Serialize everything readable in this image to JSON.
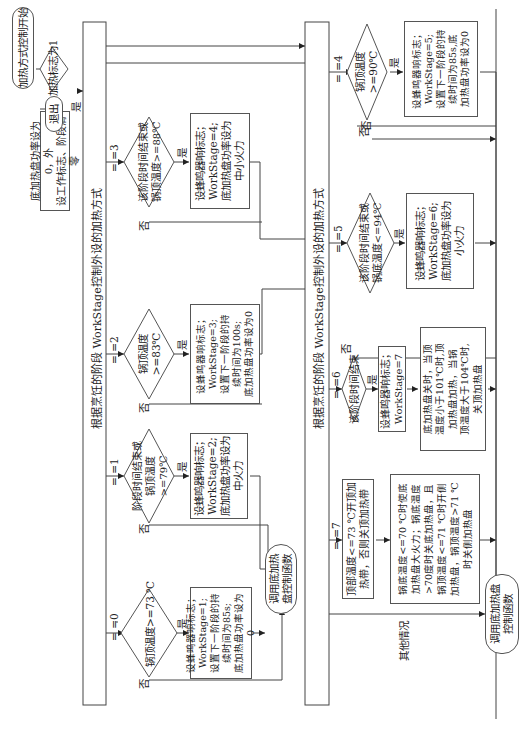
{
  "diagram": {
    "orientation": "rotated 90 degrees clockwise",
    "start": "加热方式控制开始",
    "flag_check": {
      "text": "加热标志为1",
      "yes": "是",
      "no": "否"
    },
    "reset_box": "底加热盘功率设为0，外\n设工作标志、阶段清零",
    "exit": "退出",
    "section_title_top": "根据烹饪的阶段 WorkStage控制外设的加热方式",
    "section_title_bottom": "根据烹饪的阶段 WorkStage控制外设的加热方式",
    "branches": [
      {
        "case": "= =0",
        "decision": "锅顶温度>=73 ℃",
        "yes": "是",
        "no": "否",
        "action": "设蜂鸣器响标志；\nWorkStage=1;\n设置下一阶段的持\n续时间为85s;\n底加热盘功率设为0"
      },
      {
        "case": "= =1",
        "decision": "阶段时间结束或\n锅顶温度>=79℃",
        "yes": "是",
        "no": "否",
        "action": "设蜂鸣器响标志；\nWorkStage=2;\n底加热盘功率设为\n中火力"
      },
      {
        "case": "= =2",
        "decision": "锅顶温度>=83℃",
        "yes": "是",
        "no": "否",
        "action": "设蜂鸣器响标志；\nWorkStage=3;\n设置下一阶段的持\n续时间为100s;\n底加热盘功率设为0"
      },
      {
        "case": "= =3",
        "decision": "该阶段时间结束或\n锅顶温度>=88℃",
        "yes": "是",
        "no": "否",
        "action": "设蜂鸣器响标志；\nWorkStage=4;\n底加热盘功率设为\n中小火力"
      },
      {
        "case": "= =4",
        "decision": "锅顶温度>=90℃",
        "yes": "是",
        "no": "否",
        "action": "设蜂鸣器响标志；\nWorkStage=5;\n设置下一阶段的持\n续时间为85s,底\n加热盘功率设为0"
      },
      {
        "case": "= =5",
        "decision": "该阶段时间结束或\n锅底温度<=94℃",
        "yes": "是",
        "no": "否",
        "action": "设蜂鸣器响标志；\nWorkStage=6;\n底加热盘功率设为\n小火力"
      },
      {
        "case": "= =6",
        "decision": "该阶段时间结束",
        "yes": "是",
        "no": "否",
        "action": "设蜂鸣器响标志；\nWorkStage=7",
        "action2": "底加热盘关时，当顶\n温度小于101℃时,顶\n加热盘加热，当锅\n顶温度大于104℃时,\n关顶加热盘"
      },
      {
        "case": "= =7",
        "action": "顶部温度<=73 ℃开顶加\n热带，否则关顶加热带",
        "action2": "锅底温度<=70 ℃时使底\n加热盘大火力；锅底温度\n>70度时关底加热盘，且\n锅顶温度<=71 ℃时开侧\n加热盘，锅顶温度>71 ℃\n时关侧加热盘"
      }
    ],
    "other_case": "其他情况",
    "call_function_1": "调用底加热\n盘控制函数",
    "call_function_2": "调用底加热盘\n控制函数"
  }
}
